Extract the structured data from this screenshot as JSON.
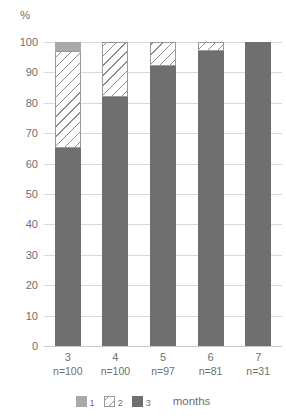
{
  "chart_data": {
    "type": "bar",
    "subtype": "stacked-100-percent",
    "title": "",
    "subtitle": "",
    "xlabel": "months",
    "ylabel": "%",
    "ylim": [
      0,
      100
    ],
    "ytick_step": 10,
    "yticks": [
      "100",
      "90",
      "80",
      "70",
      "60",
      "50",
      "40",
      "30",
      "20",
      "10",
      "0"
    ],
    "grid": true,
    "legend_position": "bottom",
    "categories": [
      "3",
      "4",
      "5",
      "6",
      "7"
    ],
    "category_sublabels": [
      "n=100",
      "n=100",
      "n=97",
      "n=81",
      "n=31"
    ],
    "series": [
      {
        "name": "1",
        "color": "#a9a9a9",
        "values": [
          3,
          0,
          0,
          0,
          0
        ]
      },
      {
        "name": "2",
        "color": "#ffffff",
        "pattern": "diagonal-hatch",
        "values": [
          32,
          18,
          8,
          3,
          0
        ]
      },
      {
        "name": "3",
        "color": "#6f6f6f",
        "values": [
          65,
          82,
          92,
          97,
          100
        ]
      }
    ]
  },
  "legend": {
    "items": [
      {
        "label": "1",
        "swatch": "light-gray-square"
      },
      {
        "label": "2",
        "swatch": "hatched-square"
      },
      {
        "label": "3",
        "swatch": "dark-gray-square"
      }
    ],
    "axis_title": "months"
  },
  "colors": {
    "series1": "#a9a9a9",
    "series2_outline": "#9a9a9a",
    "series3": "#6f6f6f",
    "gridline": "#d9d9d9",
    "text": "#6f6f6f",
    "background": "#ffffff"
  }
}
